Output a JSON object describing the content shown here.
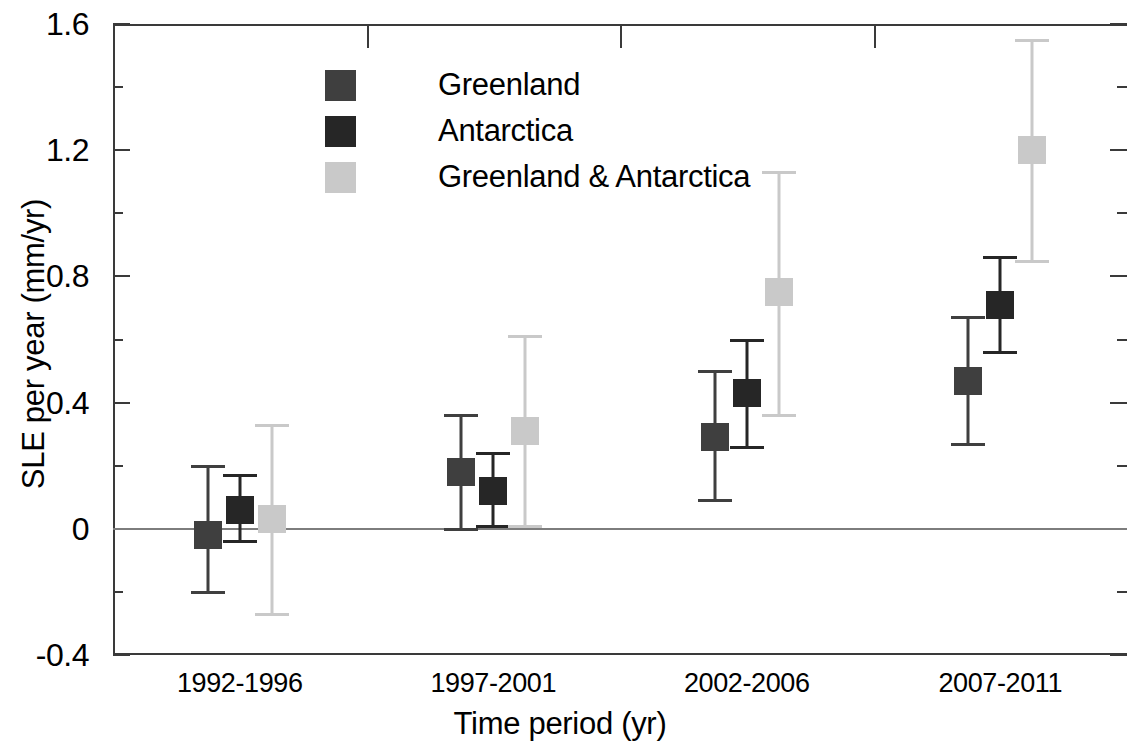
{
  "chart_data": {
    "type": "scatter",
    "title": "",
    "xlabel": "Time period (yr)",
    "ylabel": "SLE per year (mm/yr)",
    "categories": [
      "1992-1996",
      "1997-2001",
      "2002-2006",
      "2007-2011"
    ],
    "ylim": [
      -0.4,
      1.6
    ],
    "ytick_labels": [
      "1.6",
      "1.2",
      "0.8",
      "0.4",
      "0",
      "-0.4"
    ],
    "ytick_values": [
      1.6,
      1.2,
      0.8,
      0.4,
      0,
      -0.4
    ],
    "yminor_values": [
      1.4,
      1.0,
      0.6,
      0.2,
      -0.2
    ],
    "grid": false,
    "legend_position": "upper-left-inside",
    "series": [
      {
        "name": "Greenland",
        "color": "#3f3f3f",
        "values": [
          -0.02,
          0.18,
          0.29,
          0.47
        ],
        "err_high": [
          0.2,
          0.36,
          0.5,
          0.67
        ],
        "err_low": [
          -0.2,
          0.0,
          0.09,
          0.27
        ]
      },
      {
        "name": "Antarctica",
        "color": "#262626",
        "values": [
          0.06,
          0.12,
          0.43,
          0.71
        ],
        "err_high": [
          0.17,
          0.24,
          0.6,
          0.86
        ],
        "err_low": [
          -0.04,
          0.01,
          0.26,
          0.56
        ]
      },
      {
        "name": "Greenland & Antarctica",
        "color": "#c9c9c9",
        "values": [
          0.03,
          0.31,
          0.75,
          1.2
        ],
        "err_high": [
          0.33,
          0.61,
          1.13,
          1.55
        ],
        "err_low": [
          -0.27,
          0.01,
          0.36,
          0.85
        ]
      }
    ]
  },
  "legend": {
    "items": [
      {
        "label": "Greenland",
        "color": "#3f3f3f"
      },
      {
        "label": "Antarctica",
        "color": "#262626"
      },
      {
        "label": "Greenland & Antarctica",
        "color": "#c9c9c9"
      }
    ]
  },
  "axes": {
    "zero_line_color": "#7d7d7d",
    "frame_color": "#3a3a3a"
  }
}
